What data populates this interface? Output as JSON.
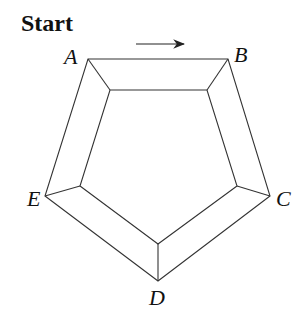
{
  "title": "Start",
  "labels": {
    "A": "A",
    "B": "B",
    "C": "C",
    "D": "D",
    "E": "E"
  },
  "diagram": {
    "type": "pentagonal frame (frustum viewed from above)",
    "outer_vertices": {
      "A": [
        88,
        59
      ],
      "B": [
        228,
        59
      ],
      "C": [
        270,
        196
      ],
      "D": [
        158,
        281
      ],
      "E": [
        45,
        196
      ]
    },
    "inner_vertices": {
      "A": [
        110,
        90
      ],
      "B": [
        207,
        90
      ],
      "C": [
        237,
        186
      ],
      "D": [
        158,
        244
      ],
      "E": [
        80,
        186
      ]
    },
    "arrow": {
      "from": [
        136,
        44
      ],
      "to": [
        184,
        44
      ],
      "direction": "A to B"
    },
    "stroke_color": "#333333"
  }
}
